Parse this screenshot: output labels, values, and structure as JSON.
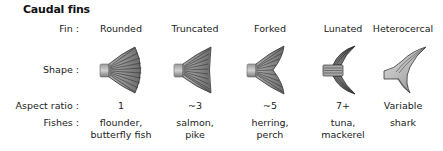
{
  "title": "Caudal fins",
  "row_labels": {
    "fin": "Fin :",
    "shape": "Shape :",
    "aspect_ratio": "Aspect ratio :",
    "fishes": "Fishes :"
  },
  "columns": [
    {
      "fin": "Rounded",
      "shape_icon": "rounded-fin-icon",
      "aspect_ratio": "1",
      "fishes_line1": "flounder,",
      "fishes_line2": "butterfly fish"
    },
    {
      "fin": "Truncated",
      "shape_icon": "truncated-fin-icon",
      "aspect_ratio": "~3",
      "fishes_line1": "salmon,",
      "fishes_line2": "pike"
    },
    {
      "fin": "Forked",
      "shape_icon": "forked-fin-icon",
      "aspect_ratio": "~5",
      "fishes_line1": "herring,",
      "fishes_line2": "perch"
    },
    {
      "fin": "Lunated",
      "shape_icon": "lunated-fin-icon",
      "aspect_ratio": "7+",
      "fishes_line1": "tuna,",
      "fishes_line2": "mackerel"
    },
    {
      "fin": "Heterocercal",
      "shape_icon": "heterocercal-fin-icon",
      "aspect_ratio": "Variable",
      "fishes_line1": "shark",
      "fishes_line2": ""
    }
  ],
  "colors": {
    "fin_dark": "#3a3a3a",
    "fin_mid": "#8a8a8a",
    "fin_light": "#d8d8d8",
    "text": "#222222"
  }
}
